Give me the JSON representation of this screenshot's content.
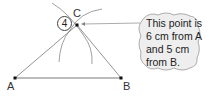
{
  "diagram": {
    "step_number": "4",
    "points": [
      {
        "label": "A",
        "x": 15,
        "y": 78
      },
      {
        "label": "B",
        "x": 121,
        "y": 78
      },
      {
        "label": "C",
        "x": 77,
        "y": 25
      }
    ],
    "callout": {
      "lines": [
        "This point is",
        "6 cm from A",
        "and 5 cm",
        "from B."
      ]
    },
    "colors": {
      "line": "#555555",
      "arc": "#666666",
      "bubble_fill": "#eeeeee",
      "bubble_stroke": "#999999"
    }
  }
}
